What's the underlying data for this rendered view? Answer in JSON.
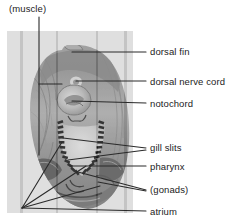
{
  "figure": {
    "panel": {
      "x": 7,
      "y": 31,
      "w": 126,
      "h": 182,
      "fill": "#dcdcdc"
    },
    "line_color": "#2a2a2a",
    "text_color": "#1b1b1b"
  },
  "labels": [
    {
      "id": "muscle",
      "text": "(muscle)",
      "x": 9,
      "y": 3
    },
    {
      "id": "dorsal_fin",
      "text": "dorsal fin",
      "x": 150,
      "y": 46
    },
    {
      "id": "dorsal_nerve_cord",
      "text": "dorsal nerve cord",
      "x": 150,
      "y": 76
    },
    {
      "id": "notochord",
      "text": "notochord",
      "x": 150,
      "y": 98
    },
    {
      "id": "gill_slits",
      "text": "gill slits",
      "x": 150,
      "y": 142
    },
    {
      "id": "pharynx",
      "text": "pharynx",
      "x": 150,
      "y": 161
    },
    {
      "id": "gonads",
      "text": "(gonads)",
      "x": 150,
      "y": 184
    },
    {
      "id": "atrium",
      "text": "atrium",
      "x": 150,
      "y": 206
    }
  ],
  "leaders": {
    "muscle": "M39,17 L39,155 M39,84 L62,84",
    "dorsal_fin": "M72,52 L146,52",
    "nerve_cord": "M76,81 L146,81",
    "notochord": "M72,101 L146,103",
    "gill_slits": "M63,138 L146,148 M68,160 L146,150",
    "pharynx": "M70,166 L146,166",
    "gonads": "M78,172 L146,190 M98,182 L146,191",
    "atrium": "M22,208 L146,211 M22,208 L62,142 M22,208 L86,166 M22,208 L100,186"
  },
  "specimen": {
    "body_outline_note": "oval cross-section body",
    "gill_slit_marks": 26,
    "tone_dark": "#6f6f6f",
    "tone_mid": "#9a9a9a",
    "tone_light": "#c4c4c4"
  }
}
